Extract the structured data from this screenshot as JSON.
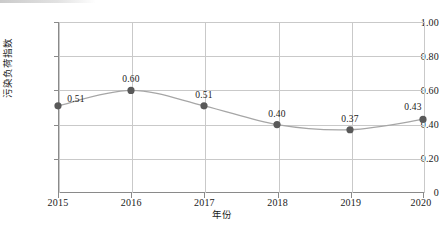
{
  "chart_data": {
    "type": "line",
    "title": "",
    "xlabel": "年份",
    "ylabel": "污染负荷指数",
    "categories": [
      "2015",
      "2016",
      "2017",
      "2018",
      "2019",
      "2020"
    ],
    "x": [
      2015,
      2016,
      2017,
      2018,
      2019,
      2020
    ],
    "values": [
      0.51,
      0.6,
      0.51,
      0.4,
      0.37,
      0.43
    ],
    "point_labels": [
      "0.51",
      "0.60",
      "0.51",
      "0.40",
      "0.37",
      "0.43"
    ],
    "ylim": [
      0,
      1.0
    ],
    "xlim": [
      2015,
      2020
    ],
    "ytick_values": [
      1.0,
      0.8,
      0.6,
      0.4,
      0.2,
      0
    ],
    "ytick_labels": [
      "1.00",
      "0.80",
      "0.60",
      "0.40",
      "0.20",
      "0"
    ],
    "xtick_labels": [
      "2015",
      "2016",
      "2017",
      "2018",
      "2019",
      "2020"
    ],
    "grid": "horizontal-and-vertical",
    "legend": "none",
    "smooth": true,
    "series_name": "污染负荷指数",
    "marker": "circle",
    "colors": {
      "line": "#a6a6a6",
      "marker": "#595959",
      "grid": "#c9c9c9",
      "axis": "#8a8a8a",
      "text": "#1a1a1a"
    }
  }
}
